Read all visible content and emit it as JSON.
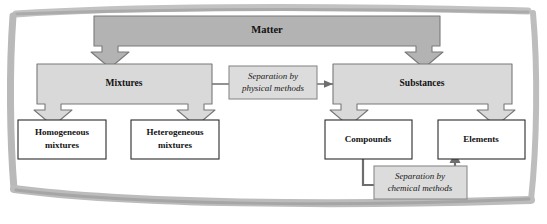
{
  "diagram": {
    "colors": {
      "root_fill": "#b3b3b3",
      "branch_fill": "#d9d9d9",
      "leaf_fill": "#ffffff",
      "note_fill": "#dcdcdc",
      "stroke": "#6e6e6e",
      "leaf_stroke": "#2b2b2b",
      "connector": "#6e6e6e",
      "frame": "#b5b5b5",
      "background": "#ffffff"
    },
    "nodes": {
      "root": {
        "label": "Matter"
      },
      "branch_left": {
        "label": "Mixtures"
      },
      "branch_right": {
        "label": "Substances"
      },
      "leaf_1": {
        "line1": "Homogeneous",
        "line2": "mixtures"
      },
      "leaf_2": {
        "line1": "Heterogeneous",
        "line2": "mixtures"
      },
      "leaf_3": {
        "line1": "Compounds",
        "line2": ""
      },
      "leaf_4": {
        "line1": "Elements",
        "line2": ""
      }
    },
    "notes": {
      "physical": {
        "line1": "Separation by",
        "line2": "physical methods"
      },
      "chemical": {
        "line1": "Separation by",
        "line2": "chemical methods"
      }
    }
  }
}
